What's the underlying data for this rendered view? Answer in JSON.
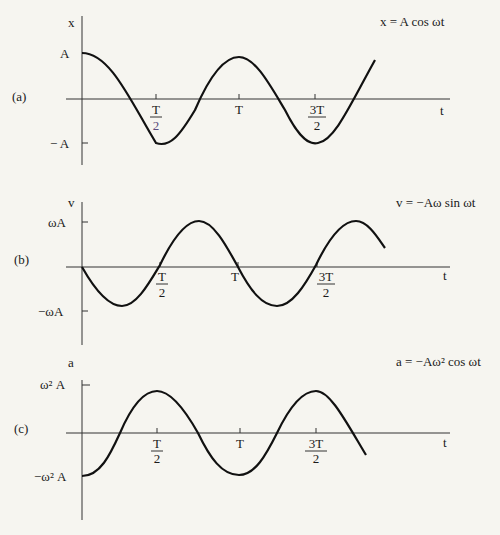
{
  "panels": [
    {
      "id": "a",
      "panel_label": "(a)",
      "y_axis_label": "x",
      "x_axis_label": "t",
      "equation": "x = A cos ωt",
      "y_ticks": {
        "top": "A",
        "bottom": "− A"
      },
      "x_ticks": [
        {
          "num": "T",
          "den": "2"
        },
        {
          "num": "T",
          "den": ""
        },
        {
          "num": "3T",
          "den": "2"
        }
      ]
    },
    {
      "id": "b",
      "panel_label": "(b)",
      "y_axis_label": "v",
      "x_axis_label": "t",
      "equation": "v = −Aω sin ωt",
      "y_ticks": {
        "top": "ωA",
        "bottom": "−ωA"
      },
      "x_ticks": [
        {
          "num": "T",
          "den": "2"
        },
        {
          "num": "T",
          "den": ""
        },
        {
          "num": "3T",
          "den": "2"
        }
      ]
    },
    {
      "id": "c",
      "panel_label": "(c)",
      "y_axis_label": "a",
      "x_axis_label": "t",
      "equation": "a = −Aω² cos ωt",
      "y_ticks": {
        "top": "ω² A",
        "bottom": "−ω² A"
      },
      "x_ticks": [
        {
          "num": "T",
          "den": "2"
        },
        {
          "num": "T",
          "den": ""
        },
        {
          "num": "3T",
          "den": "2"
        }
      ]
    }
  ],
  "colors": {
    "background": "#f6f5f0",
    "ink": "#1a1a1a"
  }
}
